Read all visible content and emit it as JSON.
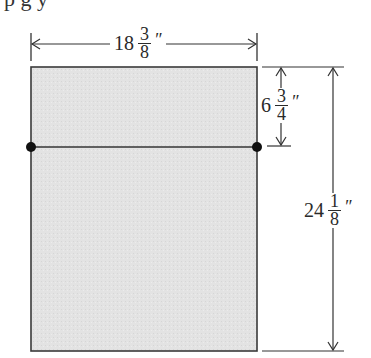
{
  "header_text_fragment": "p                g y",
  "diagram": {
    "colors": {
      "fill": "#e4e4e4",
      "stroke": "#333333",
      "dot": "#111111"
    },
    "width_dimension": {
      "whole": "18",
      "numerator": "3",
      "denominator": "8",
      "unit": "″"
    },
    "partial_height_dimension": {
      "whole": "6",
      "numerator": "3",
      "denominator": "4",
      "unit": "″"
    },
    "height_dimension": {
      "whole": "24",
      "numerator": "1",
      "denominator": "8",
      "unit": "″"
    }
  }
}
